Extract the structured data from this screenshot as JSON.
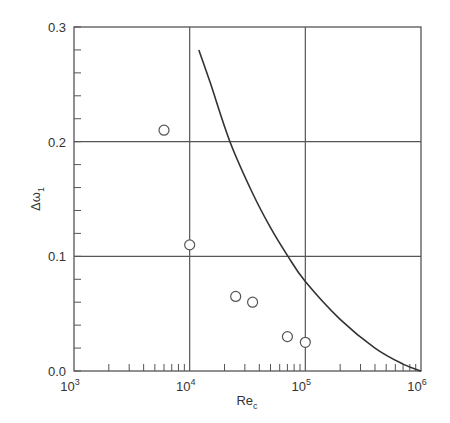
{
  "chart_data": {
    "type": "scatter",
    "title": "",
    "xlabel": "Re",
    "xlabel_subscript": "c",
    "ylabel": "Δω",
    "ylabel_subscript": "1",
    "xscale": "log",
    "xlim": [
      1000,
      1000000
    ],
    "ylim": [
      0.0,
      0.3
    ],
    "grid": true,
    "x_ticks": [
      1000,
      10000,
      100000,
      1000000
    ],
    "x_tick_labels": [
      {
        "base": "10",
        "exp": "3"
      },
      {
        "base": "10",
        "exp": "4"
      },
      {
        "base": "10",
        "exp": "5"
      },
      {
        "base": "10",
        "exp": "6"
      }
    ],
    "y_ticks": [
      0.0,
      0.1,
      0.2,
      0.3
    ],
    "y_tick_labels": [
      "0.0",
      "0.1",
      "0.2",
      "0.3"
    ],
    "y_minor_step": 0.02,
    "series": [
      {
        "name": "measured",
        "type": "scatter",
        "marker": "open-circle",
        "x": [
          6000,
          10000,
          25000,
          35000,
          70000,
          100000
        ],
        "y": [
          0.21,
          0.11,
          0.065,
          0.06,
          0.03,
          0.025
        ]
      },
      {
        "name": "model",
        "type": "line",
        "x": [
          12000,
          15000,
          22300,
          35000,
          50000,
          70800,
          100000,
          200000,
          400000,
          700000,
          1000000
        ],
        "y": [
          0.28,
          0.252,
          0.2,
          0.155,
          0.125,
          0.1,
          0.078,
          0.045,
          0.02,
          0.006,
          0.0
        ]
      }
    ],
    "legend": null
  }
}
